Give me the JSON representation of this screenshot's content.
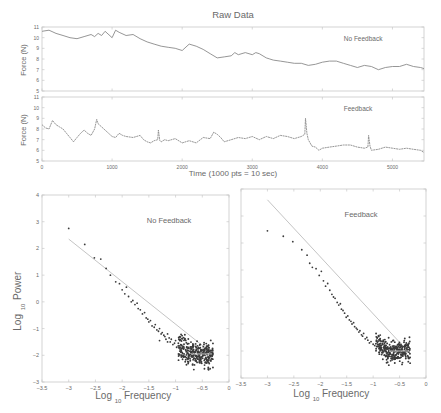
{
  "figure": {
    "title": "Raw Data",
    "time_xlabel": "Time (1000 pts = 10 sec)",
    "force_ylabel": "Force (N)",
    "power_ylabel_main": "Log",
    "power_ylabel_sub": "10",
    "power_ylabel_tail": "Power",
    "freq_xlabel_main": "Log",
    "freq_xlabel_sub": "10",
    "freq_xlabel_tail": "Frequency",
    "colors": {
      "axis": "#c8c8c8",
      "line": "#8a8a8a",
      "points": "#3a3a3a",
      "fit": "#bdbdbd",
      "text": "#6a6a6a"
    }
  },
  "chart_data": [
    {
      "id": "raw-no-feedback",
      "type": "line",
      "title": "Raw Data",
      "annotation": "No Feedback",
      "xlabel": "",
      "ylabel": "Force (N)",
      "xlim": [
        0,
        5450
      ],
      "ylim": [
        5,
        11
      ],
      "yticks": [
        5,
        6,
        7,
        8,
        9,
        10,
        11
      ],
      "xticks": [
        0,
        1000,
        2000,
        3000,
        4000,
        5000
      ],
      "show_xtick_labels": false,
      "x": [
        0,
        100,
        200,
        300,
        400,
        500,
        600,
        700,
        750,
        800,
        850,
        900,
        1000,
        1050,
        1100,
        1200,
        1300,
        1400,
        1500,
        1600,
        1700,
        1800,
        1900,
        2000,
        2100,
        2200,
        2300,
        2400,
        2500,
        2600,
        2700,
        2750,
        2800,
        2900,
        3000,
        3050,
        3100,
        3200,
        3250,
        3300,
        3400,
        3500,
        3600,
        3700,
        3800,
        3900,
        4000,
        4100,
        4200,
        4300,
        4400,
        4500,
        4600,
        4700,
        4800,
        4900,
        5000,
        5100,
        5200,
        5300,
        5400,
        5450
      ],
      "y": [
        10.6,
        10.7,
        10.4,
        10.2,
        10.0,
        9.9,
        10.1,
        10.3,
        10.1,
        10.4,
        10.2,
        10.6,
        10.0,
        10.7,
        10.5,
        10.2,
        10.3,
        9.9,
        9.6,
        9.4,
        9.2,
        9.1,
        9.0,
        8.8,
        9.4,
        9.2,
        8.9,
        8.5,
        8.1,
        8.2,
        8.3,
        8.6,
        8.4,
        8.6,
        8.4,
        8.6,
        8.5,
        8.1,
        8.0,
        7.9,
        7.8,
        7.7,
        7.6,
        7.6,
        7.4,
        7.5,
        7.7,
        7.8,
        7.8,
        7.6,
        7.4,
        7.2,
        7.4,
        7.3,
        7.0,
        7.2,
        7.3,
        7.3,
        7.5,
        7.3,
        7.2,
        7.1
      ]
    },
    {
      "id": "raw-feedback",
      "type": "line",
      "annotation": "Feedback",
      "xlabel": "Time (1000 pts = 10 sec)",
      "ylabel": "Force (N)",
      "xlim": [
        0,
        5450
      ],
      "ylim": [
        5,
        11
      ],
      "yticks": [
        5,
        6,
        7,
        8,
        9,
        10,
        11
      ],
      "xticks": [
        0,
        1000,
        2000,
        3000,
        4000,
        5000
      ],
      "show_xtick_labels": true,
      "x": [
        0,
        50,
        100,
        150,
        200,
        250,
        300,
        350,
        400,
        450,
        500,
        550,
        600,
        650,
        700,
        750,
        780,
        800,
        850,
        900,
        950,
        1000,
        1050,
        1100,
        1150,
        1200,
        1300,
        1400,
        1450,
        1500,
        1550,
        1600,
        1650,
        1660,
        1680,
        1700,
        1750,
        1800,
        1900,
        2000,
        2100,
        2200,
        2300,
        2400,
        2450,
        2500,
        2550,
        2600,
        2700,
        2800,
        2900,
        3000,
        3100,
        3200,
        3300,
        3400,
        3500,
        3600,
        3700,
        3750,
        3760,
        3780,
        3800,
        3850,
        3900,
        3950,
        4000,
        4100,
        4200,
        4300,
        4400,
        4500,
        4600,
        4650,
        4660,
        4680,
        4700,
        4800,
        4900,
        5000,
        5100,
        5200,
        5300,
        5400,
        5450
      ],
      "y": [
        8.4,
        8.1,
        8.0,
        8.8,
        8.4,
        8.2,
        8.0,
        7.6,
        7.2,
        6.8,
        7.2,
        7.6,
        7.9,
        7.6,
        7.4,
        8.0,
        8.9,
        8.5,
        8.2,
        7.9,
        7.6,
        7.3,
        7.2,
        7.6,
        7.4,
        7.3,
        7.2,
        7.4,
        7.0,
        6.8,
        6.7,
        6.9,
        7.0,
        7.9,
        6.9,
        6.8,
        7.0,
        6.9,
        7.1,
        6.7,
        6.9,
        6.7,
        7.2,
        7.1,
        7.7,
        7.5,
        7.2,
        6.8,
        7.0,
        7.2,
        7.1,
        7.3,
        7.0,
        7.3,
        7.1,
        7.4,
        7.3,
        7.1,
        7.3,
        7.5,
        9.0,
        7.6,
        7.0,
        6.4,
        6.3,
        6.0,
        6.2,
        6.3,
        6.4,
        6.5,
        6.5,
        6.3,
        6.2,
        6.3,
        7.4,
        6.4,
        6.0,
        6.1,
        6.3,
        6.2,
        6.1,
        6.2,
        6.1,
        6.0,
        5.8
      ]
    },
    {
      "id": "spectrum-no-feedback",
      "type": "scatter",
      "annotation": "No Feedback",
      "xlabel": "Log10 Frequency",
      "ylabel": "Log10 Power",
      "xlim": [
        -3.5,
        0
      ],
      "ylim": [
        -3,
        4
      ],
      "xticks": [
        -3.5,
        -3,
        -2.5,
        -2,
        -1.5,
        -1,
        -0.5,
        0
      ],
      "yticks": [
        -3,
        -2,
        -1,
        0,
        1,
        2,
        3,
        4
      ],
      "fit_line": {
        "x": [
          -3.0,
          -0.3
        ],
        "y": [
          2.35,
          -1.95
        ]
      },
      "points_sparse": {
        "x": [
          -3.0,
          -2.7,
          -2.52,
          -2.4,
          -2.3,
          -2.22,
          -2.12,
          -2.05,
          -2.0,
          -1.95,
          -1.92,
          -1.88,
          -1.83,
          -1.8,
          -1.76,
          -1.72,
          -1.7,
          -1.66,
          -1.62,
          -1.58,
          -1.55,
          -1.52,
          -1.5,
          -1.47,
          -1.44,
          -1.4,
          -1.38,
          -1.35,
          -1.32,
          -1.3,
          -1.27,
          -1.25,
          -1.22,
          -1.2,
          -1.18,
          -1.15,
          -1.12,
          -1.1,
          -1.08,
          -1.05,
          -1.02,
          -1.0,
          -0.98,
          -0.95,
          -1.3,
          -1.15
        ],
        "y": [
          2.75,
          2.15,
          1.65,
          1.6,
          1.25,
          1.0,
          0.75,
          0.68,
          0.45,
          0.3,
          0.55,
          0.2,
          0.0,
          0.05,
          -0.1,
          -0.05,
          -0.25,
          -0.3,
          -0.45,
          -0.4,
          -0.6,
          -0.65,
          -0.75,
          -0.7,
          -0.9,
          -0.95,
          -0.85,
          -1.05,
          -1.1,
          -1.0,
          -1.2,
          -1.15,
          -1.25,
          -1.3,
          -1.4,
          -1.2,
          -1.35,
          -1.5,
          -1.4,
          -1.6,
          -1.55,
          -1.45,
          -1.7,
          -1.65,
          -1.45,
          -1.5
        ]
      },
      "dense_cluster": {
        "x_range": [
          -0.95,
          -0.3
        ],
        "y_center": -1.95,
        "y_spread": 0.45,
        "n": 320
      },
      "annotation_pos": [
        -1.3,
        3.0
      ]
    },
    {
      "id": "spectrum-feedback",
      "type": "scatter",
      "annotation": "Feedback",
      "xlabel": "Log10 Frequency",
      "ylabel": "",
      "xlim": [
        -3.5,
        0
      ],
      "ylim": [
        -3,
        4
      ],
      "xticks": [
        -3.5,
        -3,
        -2.5,
        -2,
        -1.5,
        -1,
        -0.5,
        0
      ],
      "yticks": [
        -3,
        -2,
        -1,
        0,
        1,
        2,
        3,
        4
      ],
      "fit_line": {
        "x": [
          -3.0,
          -0.3
        ],
        "y": [
          3.6,
          -2.1
        ]
      },
      "points_sparse": {
        "x": [
          -3.0,
          -2.7,
          -2.52,
          -2.35,
          -2.25,
          -2.2,
          -2.15,
          -2.08,
          -2.02,
          -1.98,
          -1.94,
          -1.9,
          -1.86,
          -1.82,
          -1.78,
          -1.75,
          -1.72,
          -1.68,
          -1.65,
          -1.62,
          -1.6,
          -1.57,
          -1.54,
          -1.51,
          -1.48,
          -1.45,
          -1.42,
          -1.4,
          -1.37,
          -1.35,
          -1.32,
          -1.3,
          -1.27,
          -1.25,
          -1.22,
          -1.2,
          -1.18,
          -1.15,
          -1.12,
          -1.1,
          -1.07,
          -1.04,
          -1.0,
          -0.97
        ],
        "y": [
          2.45,
          2.25,
          2.05,
          1.75,
          1.55,
          1.25,
          1.1,
          1.05,
          0.8,
          0.95,
          0.6,
          0.4,
          0.5,
          0.25,
          0.1,
          0.0,
          -0.05,
          -0.2,
          -0.3,
          -0.25,
          -0.45,
          -0.5,
          -0.6,
          -0.75,
          -0.7,
          -0.85,
          -0.9,
          -1.0,
          -0.95,
          -1.1,
          -1.15,
          -1.2,
          -1.3,
          -1.25,
          -1.4,
          -1.45,
          -1.35,
          -1.55,
          -1.5,
          -1.6,
          -1.7,
          -1.65,
          -1.75,
          -1.8
        ]
      },
      "dense_cluster": {
        "x_range": [
          -0.95,
          -0.3
        ],
        "y_center": -2.0,
        "y_spread": 0.4,
        "n": 300
      },
      "annotation_pos": [
        -1.3,
        3.0
      ]
    }
  ]
}
